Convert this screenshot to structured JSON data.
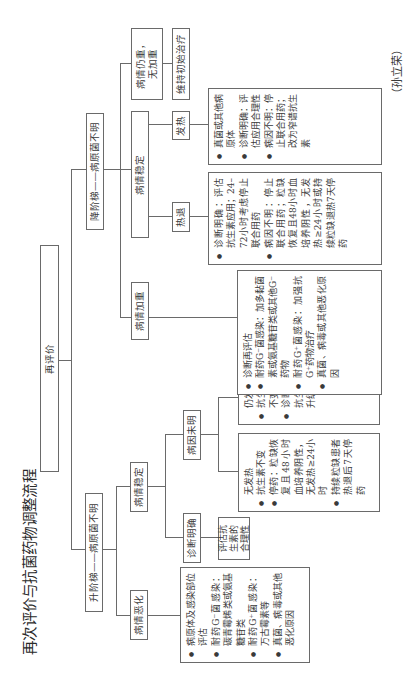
{
  "title": "再次评价与抗菌药物调整流程",
  "author": "（孙立荣）",
  "root": {
    "label": "再评价"
  },
  "escalation": {
    "label": "升阶梯——病原菌不明",
    "stable": {
      "label": "病情稳定",
      "clear_diagnosis": {
        "label": "诊断明确",
        "detail": "评估抗生素的合理性"
      },
      "unknown_cause": {
        "label": "病因未明",
        "no_fever": {
          "head": "无发热",
          "items": [
            "抗生素不变",
            "停药：粒缺恢复且48小时血培养阴性，无发热≥24小时",
            "持续粒缺患者热退后7天停药"
          ]
        },
        "still_fever": {
          "head": "仍发热",
          "items": [
            "抗生素不变",
            "诊断性抗生素升级"
          ]
        }
      }
    },
    "worsening": {
      "label": "病情恶化",
      "items": [
        "病原体及感染部位评估",
        "耐药G⁻菌感染：碳青霉烯类或氨基糖苷类",
        "耐药G⁺菌感染：万古霉素等",
        "真菌、病毒或其他恶化原因"
      ]
    }
  },
  "deescalation": {
    "label": "降阶梯——病原菌不明",
    "still_severe": {
      "label_line1": "病情仍重，",
      "label_line2": "无加重",
      "action": "维持初始治疗"
    },
    "stable": {
      "label": "病情稳定",
      "fever": {
        "label": "发热",
        "items": [
          "真菌或其他病原体",
          "诊断明确：评估应用合理性",
          "病因不明：停止联合用药；改为窄谱抗生素"
        ]
      },
      "defervescence": {
        "label": "热退",
        "items": [
          "诊断明确：评估抗生素应用；24–72小时考虑停止联合用药",
          "病因不明：停止联合用药；粒缺恢复且48小时血培养阴性，无发热≥24小时或持续粒缺退热7天停药"
        ]
      }
    },
    "worsening": {
      "label": "病情加重",
      "items": [
        "诊断再评估",
        "耐药G⁻菌感染：加多黏菌素或氨基糖苷类或其他G⁻药物",
        "耐药G⁺菌感染：加强抗G⁺药物治疗",
        "真菌、病毒或其他恶化原因"
      ]
    }
  }
}
